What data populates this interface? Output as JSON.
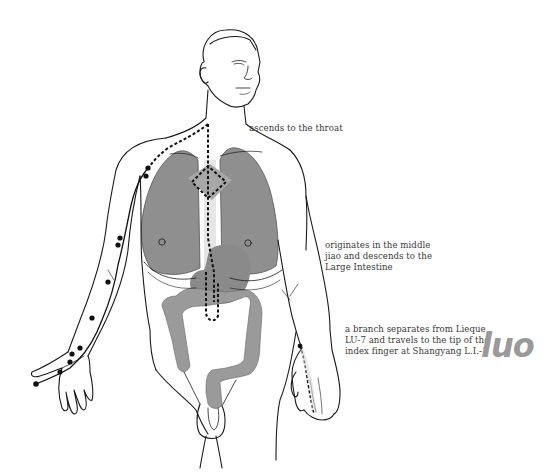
{
  "diagram": {
    "title_mark": "luo",
    "annotations": [
      {
        "id": "throat",
        "lines": [
          "ascends to the throat"
        ]
      },
      {
        "id": "origin",
        "lines": [
          "originates in the middle",
          "jiao and descends to the",
          "Large Intestine"
        ]
      },
      {
        "id": "branch",
        "lines": [
          "a branch separates from Lieque",
          "LU-7 and travels to the tip of the",
          "index finger at Shangyang L.I.-1"
        ]
      }
    ],
    "colors": {
      "outline": "#1a1a1a",
      "organ_fill": "#8c8c8c",
      "organ_fill_light": "#b0b0b0",
      "channel_line": "#111111",
      "text": "#3a3a3a",
      "mark": "#9a9a9a"
    },
    "figure": {
      "subject": "male torso front view with lung luo channel",
      "organs": [
        "lungs",
        "stomach",
        "large intestine"
      ],
      "points": [
        "Lieque LU-7",
        "Shangyang L.I.-1"
      ]
    }
  }
}
